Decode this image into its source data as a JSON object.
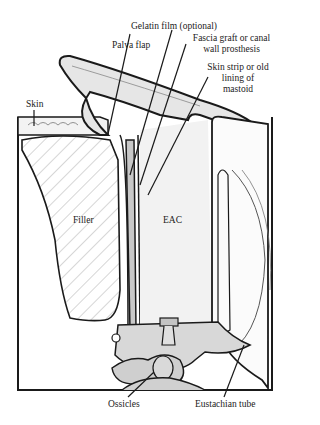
{
  "diagram": {
    "labels": {
      "gelatin_film": "Gelatin film (optional)",
      "palva_flap": "Palva flap",
      "fascia_graft_1": "Fascia graft or canal",
      "fascia_graft_2": "wall prosthesis",
      "skin_strip_1": "Skin strip or old",
      "skin_strip_2": "lining of",
      "skin_strip_3": "mastoid",
      "skin": "Skin",
      "filler": "Filler",
      "eac": "EAC",
      "ossicles": "Ossicles",
      "eustachian_tube": "Eustachian tube"
    },
    "colors": {
      "outline": "#1a1a1a",
      "shade": "#d4d4d4",
      "light_shade": "#ececec",
      "background": "#ffffff"
    }
  }
}
